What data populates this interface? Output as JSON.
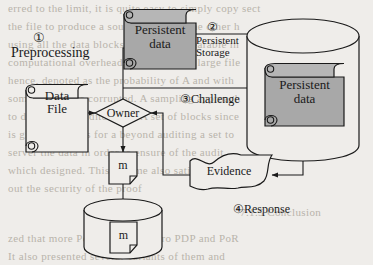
{
  "figure": {
    "kind": "process-diagram",
    "background_color": "#efedea",
    "fill_gray": "#a8a8a8",
    "stroke_color": "#1a1a1a"
  },
  "nodes": {
    "data_file": {
      "label_line1": "Data",
      "label_line2": "File",
      "shape": "scroll",
      "fill": "none"
    },
    "owner": {
      "label": "Owner",
      "shape": "diamond",
      "fill": "none"
    },
    "persistent_data_top": {
      "label_line1": "Persistent",
      "label_line2": "data",
      "shape": "scroll",
      "fill": "#a8a8a8"
    },
    "persistent_data_store": {
      "label_line1": "Persistent",
      "label_line2": "data",
      "shape": "scroll",
      "fill": "#a8a8a8"
    },
    "cylinder_storage": {
      "label": "",
      "shape": "cylinder",
      "fill": "none"
    },
    "evidence": {
      "label": "Evidence",
      "shape": "banner",
      "fill": "none"
    },
    "tag_m": {
      "label": "m",
      "shape": "document",
      "fill": "none"
    },
    "local_store": {
      "label": "m",
      "shape": "cylinder-with-document",
      "fill": "none"
    }
  },
  "labels": {
    "step1_marker": "①",
    "step1": "Preprocessing",
    "step2_marker": "②",
    "step2_line1": "Persistent",
    "step2_line2": "Storage",
    "step3": "③Challenge",
    "step4": "④Response"
  },
  "ghost_text": {
    "lines": [
      {
        "text": "erred to the limit, it is quite easy to simply copy sect",
        "x": 8,
        "y": 2,
        "size": 11
      },
      {
        "text": "the file to produce a sound proof. On the other h",
        "x": 8,
        "y": 20,
        "size": 11
      },
      {
        "text": "using all the data blocks would be unbearable in",
        "x": 8,
        "y": 38,
        "size": 11
      },
      {
        "text": "computational overhead, especially for large file",
        "x": 8,
        "y": 56,
        "size": 11
      },
      {
        "text": "hence, denoted as the probability of A and with",
        "x": 8,
        "y": 74,
        "size": 11
      },
      {
        "text": "some blocks are corrupted. A sampling approach",
        "x": 8,
        "y": 92,
        "size": 11
      },
      {
        "text": "to dedicate an auditor task. A set of blocks since",
        "x": 8,
        "y": 110,
        "size": 11
      },
      {
        "text": "is given C blocks for a beyond auditing a set to",
        "x": 8,
        "y": 128,
        "size": 11
      },
      {
        "text": "server the data in order to ensure  of the audit",
        "x": 8,
        "y": 146,
        "size": 11
      },
      {
        "text": "which designed. This scheme also satisfies a specific",
        "x": 8,
        "y": 164,
        "size": 11
      },
      {
        "text": "out the security of the proof",
        "x": 8,
        "y": 182,
        "size": 11
      },
      {
        "text": "7.1.5  Conclusion",
        "x": 240,
        "y": 206,
        "size": 11
      },
      {
        "text": "zed that more  PoR. It briefly intro PDP and PoR",
        "x": 8,
        "y": 232,
        "size": 11
      },
      {
        "text": "It also presented several variants of them and",
        "x": 8,
        "y": 250,
        "size": 11
      }
    ]
  }
}
